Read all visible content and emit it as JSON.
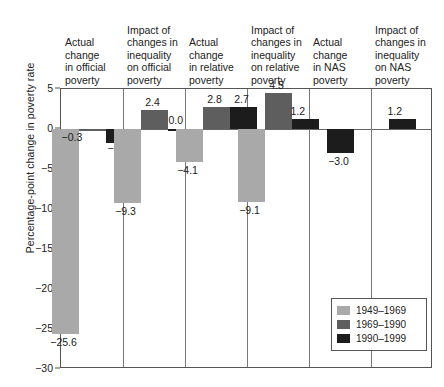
{
  "chart_data": {
    "type": "bar",
    "title": "",
    "xlabel": "",
    "ylabel": "Percentage-point change in poverty rate",
    "ylim": [
      -30,
      5
    ],
    "yticks": [
      5,
      0,
      -5,
      -10,
      -15,
      -20,
      -25,
      -30
    ],
    "ytick_labels": [
      "5",
      "0",
      "−5",
      "−10",
      "−15",
      "−20",
      "−25",
      "−30"
    ],
    "grid": false,
    "legend_position": "bottom-right",
    "categories": [
      "Actual change in official poverty",
      "Impact of changes in inequality on official poverty",
      "Actual change in relative poverty",
      "Impact of changes in inequality on relative poverty",
      "Actual change in NAS poverty",
      "Impact of changes in inequality on NAS poverty"
    ],
    "category_lines": [
      [
        "Actual",
        "change",
        "in official",
        "poverty"
      ],
      [
        "Impact of",
        "changes in",
        "inequality",
        "on official",
        "poverty"
      ],
      [
        "Actual",
        "change",
        "in relative",
        "poverty"
      ],
      [
        "Impact of",
        "changes in",
        "inequality",
        "on relative",
        "poverty"
      ],
      [
        "Actual",
        "change",
        "in NAS",
        "poverty"
      ],
      [
        "Impact of",
        "changes in",
        "inequality",
        "on NAS",
        "poverty"
      ]
    ],
    "series": [
      {
        "name": "1949–1969",
        "color": "#a9a9a9",
        "values": [
          -25.6,
          -9.3,
          -4.1,
          -9.1,
          null,
          null
        ],
        "labels": [
          "−25.6",
          "−9.3",
          "−4.1",
          "−9.1",
          "",
          ""
        ]
      },
      {
        "name": "1969–1990",
        "color": "#5e5e5e",
        "values": [
          -0.3,
          2.4,
          2.8,
          4.5,
          null,
          null
        ],
        "labels": [
          "−0.3",
          "2.4",
          "2.8",
          "4.5",
          "",
          ""
        ]
      },
      {
        "name": "1990–1999",
        "color": "#1c1c1c",
        "values": [
          -1.7,
          0.0,
          2.7,
          1.2,
          -3.0,
          1.2
        ],
        "labels": [
          "−1.7",
          "0.0",
          "2.7",
          "1.2",
          "−3.0",
          "1.2"
        ]
      }
    ]
  },
  "legend": {
    "items": [
      {
        "label": "1949–1969",
        "color": "#a9a9a9"
      },
      {
        "label": "1969–1990",
        "color": "#5e5e5e"
      },
      {
        "label": "1990–1999",
        "color": "#1c1c1c"
      }
    ]
  }
}
